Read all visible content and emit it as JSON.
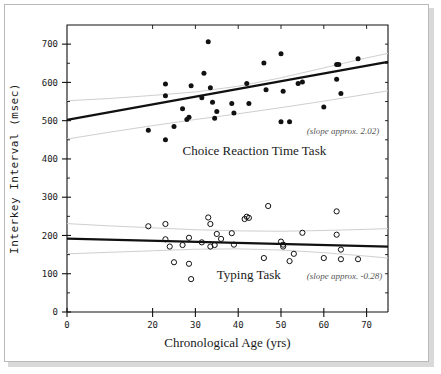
{
  "chart_data": {
    "type": "scatter",
    "title": "",
    "xlabel": "Chronological Age (yrs)",
    "ylabel": "Interkey Interval (msec)",
    "xlim": [
      0,
      75
    ],
    "ylim": [
      0,
      750
    ],
    "xticks": [
      0,
      20,
      30,
      40,
      50,
      60,
      70
    ],
    "xtick_labels": [
      "0",
      "20",
      "30",
      "40",
      "50",
      "60",
      "70"
    ],
    "yticks": [
      0,
      100,
      200,
      300,
      400,
      500,
      600,
      700
    ],
    "ytick_labels": [
      "0",
      "100",
      "200",
      "300",
      "400",
      "500",
      "600",
      "700"
    ],
    "grid": false,
    "legend_position": "inline-annotation",
    "series": [
      {
        "name": "Choice Reaction Time Task",
        "marker": "filled-circle",
        "color": "#111111",
        "label_text": "Choice Reaction Time Task",
        "label_x": 27,
        "label_y": 410,
        "annotation": "(slope approx. 2.02)",
        "annotation_x": 56,
        "annotation_y": 465,
        "fit": {
          "slope": 2.02,
          "intercept": 502,
          "x_start": 0,
          "x_end": 75
        },
        "ci_upper": [
          [
            0,
            552
          ],
          [
            10,
            558
          ],
          [
            20,
            566
          ],
          [
            30,
            575
          ],
          [
            40,
            590
          ],
          [
            50,
            612
          ],
          [
            60,
            638
          ],
          [
            70,
            664
          ],
          [
            75,
            676
          ]
        ],
        "ci_lower": [
          [
            0,
            452
          ],
          [
            10,
            470
          ],
          [
            20,
            487
          ],
          [
            30,
            503
          ],
          [
            40,
            518
          ],
          [
            50,
            534
          ],
          [
            60,
            551
          ],
          [
            70,
            569
          ],
          [
            75,
            578
          ]
        ],
        "points": [
          [
            19,
            475
          ],
          [
            23,
            596
          ],
          [
            23,
            565
          ],
          [
            23,
            450
          ],
          [
            25,
            485
          ],
          [
            27,
            531
          ],
          [
            28,
            503
          ],
          [
            28.5,
            509
          ],
          [
            29,
            591
          ],
          [
            31.5,
            560
          ],
          [
            32,
            624
          ],
          [
            33,
            706
          ],
          [
            33.5,
            586
          ],
          [
            34,
            548
          ],
          [
            34.5,
            506
          ],
          [
            35,
            524
          ],
          [
            38.5,
            545
          ],
          [
            39,
            520
          ],
          [
            42,
            597
          ],
          [
            42.5,
            545
          ],
          [
            46,
            651
          ],
          [
            46.5,
            581
          ],
          [
            50,
            675
          ],
          [
            50,
            497
          ],
          [
            50.5,
            577
          ],
          [
            52,
            497
          ],
          [
            54,
            597
          ],
          [
            55,
            601
          ],
          [
            60,
            536
          ],
          [
            63,
            647
          ],
          [
            63,
            608
          ],
          [
            63.5,
            647
          ],
          [
            64,
            571
          ],
          [
            68,
            662
          ]
        ]
      },
      {
        "name": "Typing Task",
        "marker": "open-circle",
        "color": "#111111",
        "label_text": "Typing Task",
        "label_x": 35,
        "label_y": 85,
        "annotation": "(slope approx. -0.28)",
        "annotation_x": 56,
        "annotation_y": 85,
        "fit": {
          "slope": -0.28,
          "intercept": 192,
          "x_start": 0,
          "x_end": 75
        },
        "ci_upper": [
          [
            0,
            231
          ],
          [
            10,
            225
          ],
          [
            20,
            220
          ],
          [
            30,
            215
          ],
          [
            40,
            212
          ],
          [
            50,
            211
          ],
          [
            60,
            213
          ],
          [
            70,
            216
          ],
          [
            75,
            218
          ]
        ],
        "ci_lower": [
          [
            0,
            152
          ],
          [
            10,
            156
          ],
          [
            20,
            160
          ],
          [
            30,
            164
          ],
          [
            40,
            165
          ],
          [
            50,
            162
          ],
          [
            60,
            155
          ],
          [
            70,
            146
          ],
          [
            75,
            141
          ]
        ],
        "points": [
          [
            19,
            224
          ],
          [
            23,
            230
          ],
          [
            23,
            190
          ],
          [
            24,
            171
          ],
          [
            25,
            130
          ],
          [
            27,
            175
          ],
          [
            28.5,
            126
          ],
          [
            28.5,
            194
          ],
          [
            29,
            86
          ],
          [
            31.5,
            182
          ],
          [
            33,
            247
          ],
          [
            33.5,
            230
          ],
          [
            33.5,
            171
          ],
          [
            34.5,
            175
          ],
          [
            35,
            204
          ],
          [
            36,
            191
          ],
          [
            38.5,
            206
          ],
          [
            39,
            176
          ],
          [
            41.5,
            243
          ],
          [
            42,
            249
          ],
          [
            42.5,
            246
          ],
          [
            46,
            141
          ],
          [
            47,
            277
          ],
          [
            50,
            184
          ],
          [
            50.5,
            176
          ],
          [
            50.5,
            171
          ],
          [
            52,
            133
          ],
          [
            53,
            152
          ],
          [
            55,
            207
          ],
          [
            60,
            141
          ],
          [
            63,
            263
          ],
          [
            63,
            202
          ],
          [
            64,
            163
          ],
          [
            64,
            138
          ],
          [
            68,
            138
          ]
        ]
      }
    ]
  },
  "axes": {
    "x_title": "Chronological Age (yrs)",
    "y_title": "Interkey Interval (msec)"
  }
}
